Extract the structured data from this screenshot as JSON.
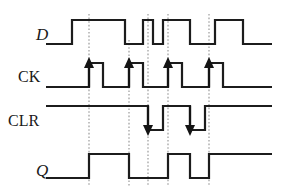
{
  "figure": {
    "type": "digital-timing-diagram",
    "width": 281,
    "height": 191,
    "background_color": "#ffffff",
    "wave_color": "#1c1c1c",
    "guide_color": "#9a9a9a"
  },
  "signals": [
    {
      "id": "d",
      "label": "D",
      "label_style": "italic",
      "label_x": 36,
      "label_y": 40,
      "row_high_y": 20,
      "row_low_y": 44,
      "path": "M 46 44 L 72 44 L 72 20 L 125 20 L 125 44 L 143 44 L 143 20 L 153 20 L 153 44 L 163 44 L 163 20 L 190 20 L 190 44 L 215 44 L 215 20 L 243 20 L 243 44 L 272 44",
      "transitions": [
        {
          "x": 72,
          "edge": "rise"
        },
        {
          "x": 125,
          "edge": "fall"
        },
        {
          "x": 143,
          "edge": "rise"
        },
        {
          "x": 153,
          "edge": "fall"
        },
        {
          "x": 163,
          "edge": "rise"
        },
        {
          "x": 190,
          "edge": "fall"
        },
        {
          "x": 215,
          "edge": "rise"
        },
        {
          "x": 243,
          "edge": "fall"
        }
      ]
    },
    {
      "id": "ck",
      "label": "CK",
      "label_style": "upright",
      "label_x": 18,
      "label_y": 82,
      "row_high_y": 63,
      "row_low_y": 87,
      "path": "M 46 87 L 89 87 L 89 63 L 103 63 L 103 87 L 129 87 L 129 63 L 143 63 L 143 87 L 168 87 L 168 63 L 182 63 L 182 87 L 209 87 L 209 63 L 223 63 L 223 87 L 272 87",
      "edge_arrows": [
        {
          "x": 89,
          "direction": "up"
        },
        {
          "x": 129,
          "direction": "up"
        },
        {
          "x": 168,
          "direction": "up"
        },
        {
          "x": 209,
          "direction": "up"
        }
      ]
    },
    {
      "id": "clr",
      "label": "CLR",
      "label_style": "upright",
      "label_x": 8,
      "label_y": 126,
      "row_high_y": 106,
      "row_low_y": 130,
      "path": "M 46 106 L 148 106 L 148 130 L 163 130 L 163 106 L 190 106 L 190 130 L 205 130 L 205 106 L 272 106",
      "edge_arrows": [
        {
          "x": 148,
          "direction": "down"
        },
        {
          "x": 190,
          "direction": "down"
        }
      ]
    },
    {
      "id": "q",
      "label": "Q",
      "label_style": "italic",
      "label_x": 36,
      "label_y": 176,
      "row_high_y": 154,
      "row_low_y": 178,
      "path": "M 46 178 L 89 178 L 89 154 L 129 154 L 129 178 L 168 178 L 168 154 L 190 154 L 190 178 L 209 178 L 209 154 L 272 154",
      "transitions": [
        {
          "x": 89,
          "edge": "rise"
        },
        {
          "x": 129,
          "edge": "fall"
        },
        {
          "x": 168,
          "edge": "rise"
        },
        {
          "x": 190,
          "edge": "fall"
        },
        {
          "x": 209,
          "edge": "rise"
        }
      ]
    }
  ],
  "guide_lines": [
    {
      "x": 89,
      "y1": 14,
      "y2": 186
    },
    {
      "x": 129,
      "y1": 40,
      "y2": 186
    },
    {
      "x": 148,
      "y1": 14,
      "y2": 186
    },
    {
      "x": 168,
      "y1": 14,
      "y2": 186
    },
    {
      "x": 209,
      "y1": 14,
      "y2": 186
    }
  ]
}
